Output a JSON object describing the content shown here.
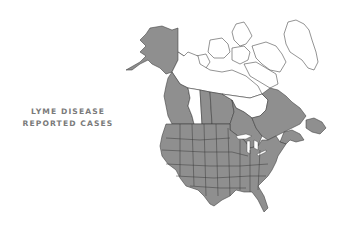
{
  "title": {
    "line1": "LYME DISEASE",
    "line2": "REPORTED CASES"
  },
  "map": {
    "region": "North America (United States and Canada)",
    "legend": {
      "reported_color": "#8f8f8f",
      "not_reported_color": "#ffffff",
      "border_color": "#3a3a3a",
      "title_color": "#7a7a7a"
    },
    "regions_reported": [
      "Alaska",
      "Contiguous United States",
      "British Columbia",
      "Saskatchewan",
      "Manitoba",
      "Ontario",
      "Quebec",
      "New Brunswick",
      "Nova Scotia",
      "Prince Edward Island",
      "Newfoundland and Labrador"
    ],
    "regions_not_reported": [
      "Yukon",
      "Northwest Territories",
      "Nunavut",
      "Alberta",
      "Greenland"
    ]
  }
}
